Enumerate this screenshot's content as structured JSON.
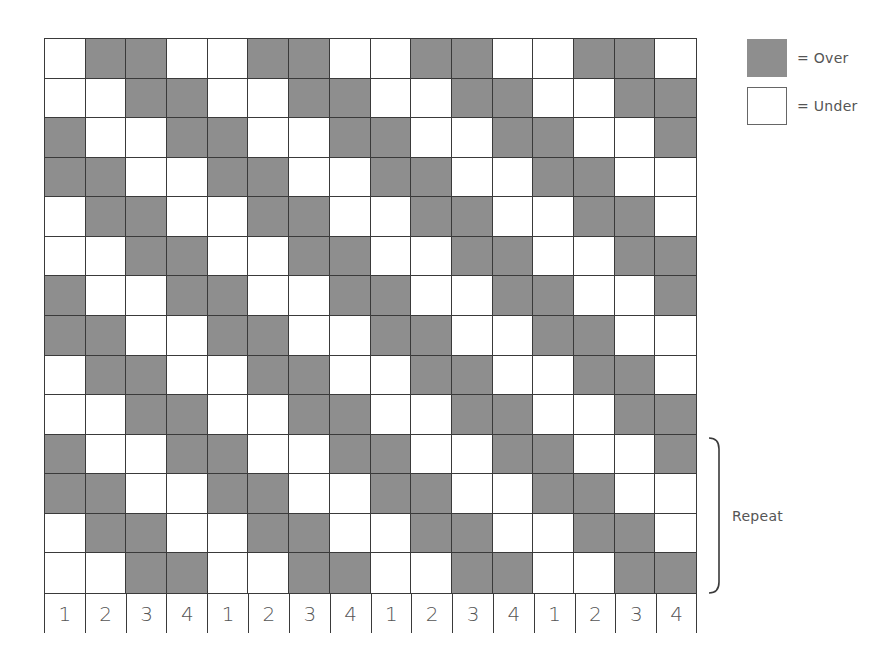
{
  "diagram": {
    "type": "weave-draft",
    "rows": 14,
    "columns": 16,
    "pattern": [
      [
        0,
        1,
        1,
        0,
        0,
        1,
        1,
        0,
        0,
        1,
        1,
        0,
        0,
        1,
        1,
        0
      ],
      [
        0,
        0,
        1,
        1,
        0,
        0,
        1,
        1,
        0,
        0,
        1,
        1,
        0,
        0,
        1,
        1
      ],
      [
        1,
        0,
        0,
        1,
        1,
        0,
        0,
        1,
        1,
        0,
        0,
        1,
        1,
        0,
        0,
        1
      ],
      [
        1,
        1,
        0,
        0,
        1,
        1,
        0,
        0,
        1,
        1,
        0,
        0,
        1,
        1,
        0,
        0
      ],
      [
        0,
        1,
        1,
        0,
        0,
        1,
        1,
        0,
        0,
        1,
        1,
        0,
        0,
        1,
        1,
        0
      ],
      [
        0,
        0,
        1,
        1,
        0,
        0,
        1,
        1,
        0,
        0,
        1,
        1,
        0,
        0,
        1,
        1
      ],
      [
        1,
        0,
        0,
        1,
        1,
        0,
        0,
        1,
        1,
        0,
        0,
        1,
        1,
        0,
        0,
        1
      ],
      [
        1,
        1,
        0,
        0,
        1,
        1,
        0,
        0,
        1,
        1,
        0,
        0,
        1,
        1,
        0,
        0
      ],
      [
        0,
        1,
        1,
        0,
        0,
        1,
        1,
        0,
        0,
        1,
        1,
        0,
        0,
        1,
        1,
        0
      ],
      [
        0,
        0,
        1,
        1,
        0,
        0,
        1,
        1,
        0,
        0,
        1,
        1,
        0,
        0,
        1,
        1
      ],
      [
        1,
        0,
        0,
        1,
        1,
        0,
        0,
        1,
        1,
        0,
        0,
        1,
        1,
        0,
        0,
        1
      ],
      [
        1,
        1,
        0,
        0,
        1,
        1,
        0,
        0,
        1,
        1,
        0,
        0,
        1,
        1,
        0,
        0
      ],
      [
        0,
        1,
        1,
        0,
        0,
        1,
        1,
        0,
        0,
        1,
        1,
        0,
        0,
        1,
        1,
        0
      ],
      [
        0,
        0,
        1,
        1,
        0,
        0,
        1,
        1,
        0,
        0,
        1,
        1,
        0,
        0,
        1,
        1
      ]
    ],
    "column_numbers": [
      "1",
      "2",
      "3",
      "4",
      "1",
      "2",
      "3",
      "4",
      "1",
      "2",
      "3",
      "4",
      "1",
      "2",
      "3",
      "4"
    ],
    "colors": {
      "over": "#8e8e8e",
      "under": "#ffffff",
      "gridline": "#3a3a3a"
    }
  },
  "legend": {
    "over_label": "= Over",
    "under_label": "= Under"
  },
  "repeat": {
    "label": "Repeat",
    "rows_covered": [
      10,
      13
    ]
  }
}
